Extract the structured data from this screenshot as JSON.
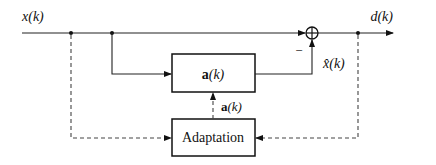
{
  "diagram": {
    "type": "adaptive-filter-block-diagram",
    "signals": {
      "input": "x(k)",
      "output": "d(k)",
      "estimate": "x̂(k)",
      "coefficients": "a(k)"
    },
    "blocks": {
      "filter": {
        "label_bold": "a",
        "label_rest": "(k)"
      },
      "adaptation": {
        "label": "Adaptation"
      }
    },
    "summer": {
      "sign_minus": "−"
    },
    "coef_label": {
      "bold": "a",
      "rest": "(k)"
    },
    "input_label": {
      "var": "x",
      "arg": "(k)"
    },
    "output_label": {
      "var": "d",
      "arg": "(k)"
    },
    "estimate_label": {
      "var": "x̂",
      "arg": "(k)"
    }
  }
}
